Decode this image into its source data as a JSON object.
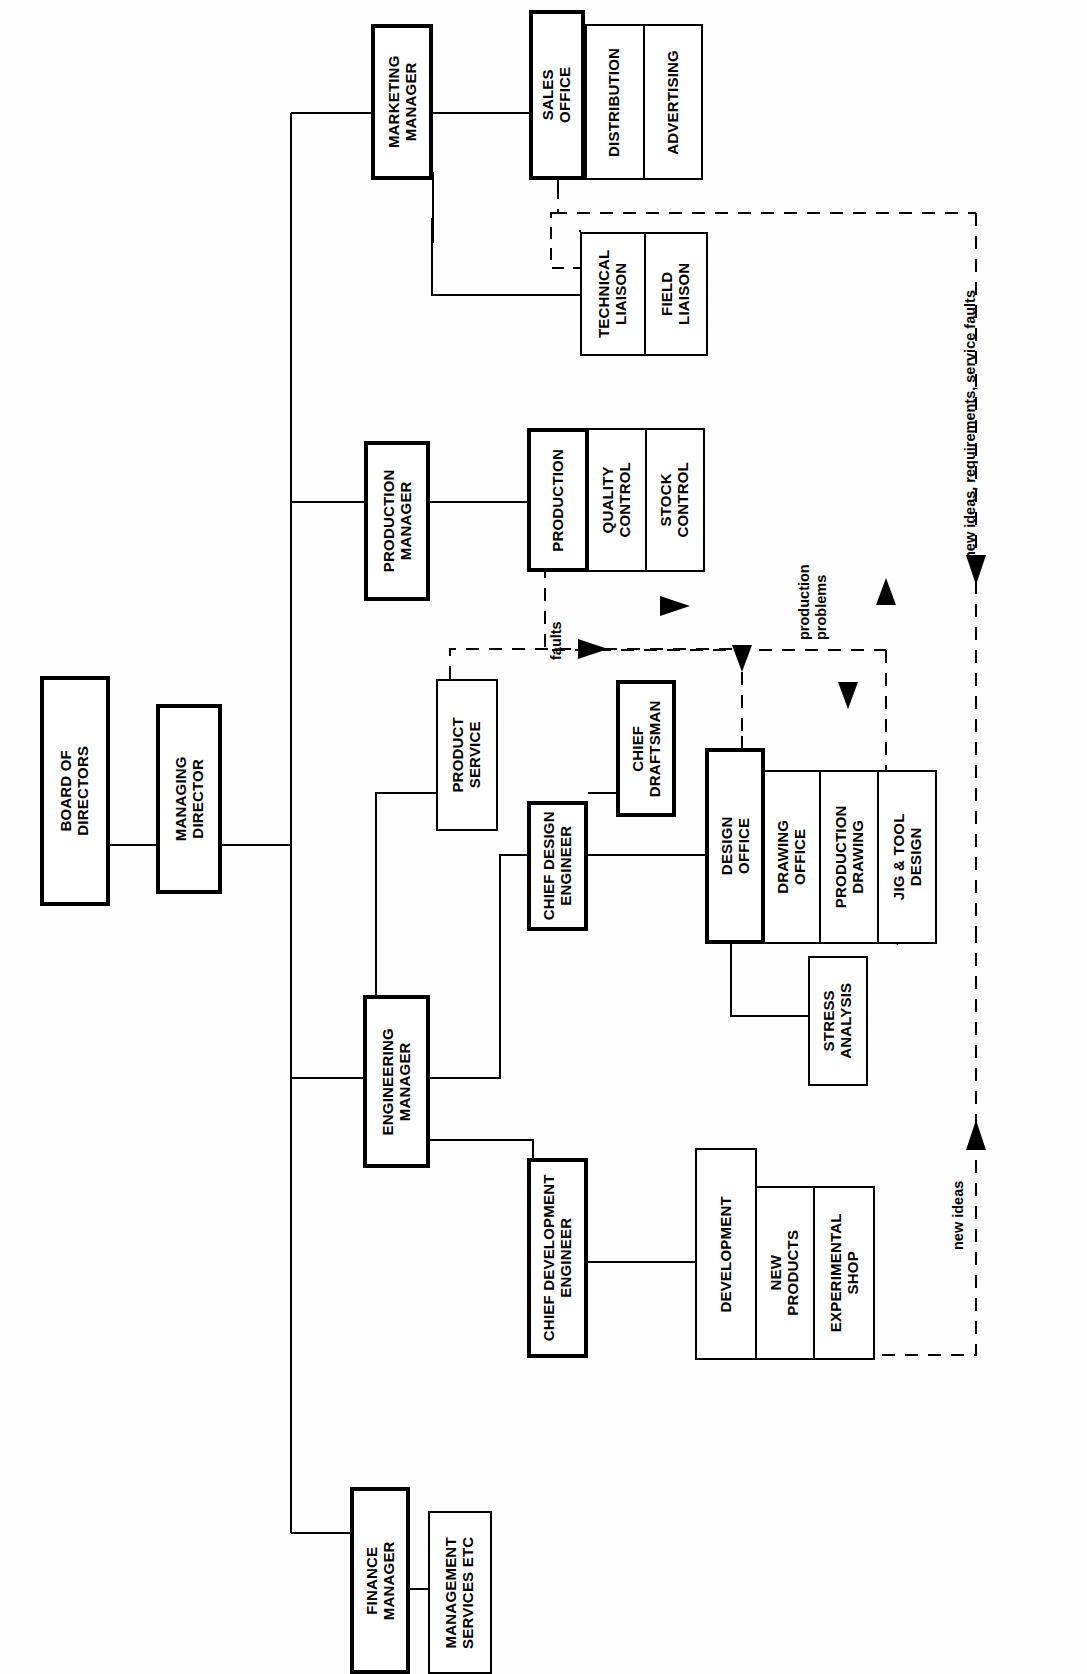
{
  "diagram": {
    "orientation": "rotated-90-ccw",
    "boxes": {
      "board_of_directors": "BOARD OF\nDIRECTORS",
      "managing_director": "MANAGING\nDIRECTOR",
      "marketing_manager": "MARKETING\nMANAGER",
      "sales_office": "SALES\nOFFICE",
      "distribution": "DISTRIBUTION",
      "advertising": "ADVERTISING",
      "technical_liaison": "TECHNICAL\nLIAISON",
      "field_liaison": "FIELD\nLIAISON",
      "production_manager": "PRODUCTION\nMANAGER",
      "production": "PRODUCTION",
      "quality_control": "QUALITY\nCONTROL",
      "stock_control": "STOCK\nCONTROL",
      "engineering_manager": "ENGINEERING\nMANAGER",
      "product_service": "PRODUCT\nSERVICE",
      "chief_design_engineer": "CHIEF DESIGN\nENGINEER",
      "chief_draftsman": "CHIEF\nDRAFTSMAN",
      "design_office": "DESIGN\nOFFICE",
      "drawing_office": "DRAWING\nOFFICE",
      "production_drawing": "PRODUCTION\nDRAWING",
      "jig_tool_design": "JIG & TOOL\nDESIGN",
      "stress_analysis": "STRESS\nANALYSIS",
      "chief_development_engineer": "CHIEF DEVELOPMENT\nENGINEER",
      "development": "DEVELOPMENT",
      "new_products": "NEW\nPRODUCTS",
      "experimental_shop": "EXPERIMENTAL\nSHOP",
      "finance_manager": "FINANCE\nMANAGER",
      "management_services": "MANAGEMENT\nSERVICES ETC"
    },
    "flow_labels": {
      "faults": "faults",
      "production_problems": "production\nproblems",
      "new_ideas_requirements_service_faults": "new ideas, requirements, service faults",
      "new_ideas": "new ideas"
    },
    "colors": {
      "line": "#000000",
      "box_fill": "#ffffff",
      "background": "#fdfdfd"
    }
  }
}
